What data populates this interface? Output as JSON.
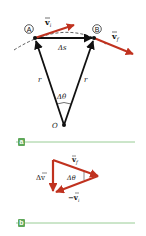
{
  "figure": {
    "panel_a": {
      "badge": "a",
      "points": [
        {
          "label": "A",
          "name": "point-a"
        },
        {
          "label": "B",
          "name": "point-b"
        },
        {
          "label": "O",
          "name": "origin"
        }
      ],
      "labels": {
        "v_i": "v",
        "v_i_sub": "i",
        "v_f": "v",
        "v_f_sub": "f",
        "delta_s": "Δs",
        "r_left": "r",
        "r_right": "r",
        "delta_theta": "Δθ",
        "origin": "O",
        "point_a": "A",
        "point_b": "B"
      }
    },
    "panel_b": {
      "badge": "b",
      "labels": {
        "v_f": "v",
        "v_f_sub": "f",
        "delta_v": "Δv",
        "delta_theta": "Δθ",
        "neg_v_i": "−v",
        "neg_v_i_sub": "i"
      }
    },
    "colors": {
      "vector_red": "#c0321f",
      "line_black": "#111111",
      "rule_green": "#7dbf78",
      "badge_green": "#5fa85a"
    }
  }
}
